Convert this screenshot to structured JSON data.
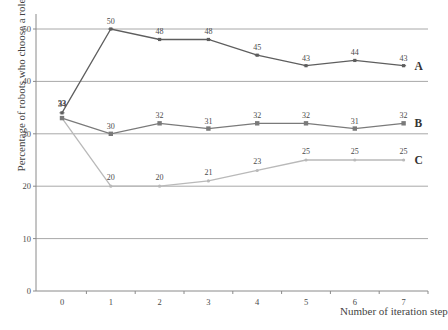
{
  "chart_data": {
    "type": "line",
    "title": "",
    "xlabel": "Number of iteration step",
    "ylabel": "Percentage of robots who choose a role",
    "categories": [
      "0",
      "1",
      "2",
      "3",
      "4",
      "5",
      "6",
      "7"
    ],
    "yticks": [
      0,
      10,
      20,
      30,
      40,
      50
    ],
    "ylim": [
      0,
      53
    ],
    "grid": true,
    "legend_position": "inline-right",
    "series": [
      {
        "name": "A",
        "values": [
          34,
          50,
          48,
          48,
          45,
          43,
          44,
          43
        ],
        "color": "#5e5e5e",
        "marker": "plus"
      },
      {
        "name": "B",
        "values": [
          33,
          30,
          32,
          31,
          32,
          32,
          31,
          32
        ],
        "color": "#7a7a7a",
        "marker": "square"
      },
      {
        "name": "C",
        "values": [
          33,
          20,
          20,
          21,
          23,
          25,
          25,
          25
        ],
        "color": "#b9b9b9",
        "marker": "dot"
      }
    ]
  },
  "colors": {
    "grid": "#a8a8a8",
    "axis": "#8a8a8a",
    "text": "#4a4a4a"
  }
}
